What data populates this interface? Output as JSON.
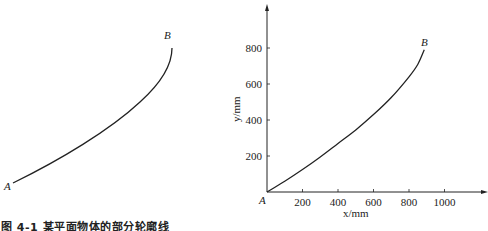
{
  "caption": "图 4-1   某平面物体的部分轮廓线",
  "left_figure": {
    "start_label": "A",
    "end_label": "B"
  },
  "chart_data": {
    "type": "line",
    "title": "",
    "xlabel": "x/mm",
    "ylabel": "y/mm",
    "xlim": [
      0,
      1200
    ],
    "ylim": [
      0,
      950
    ],
    "x_ticks": [
      200,
      400,
      600,
      800,
      1000
    ],
    "y_ticks": [
      200,
      400,
      600,
      800
    ],
    "grid": false,
    "legend": null,
    "origin_label": "A",
    "end_label": "B",
    "series": [
      {
        "name": "contour A-B",
        "x": [
          0,
          100,
          200,
          300,
          400,
          500,
          600,
          700,
          800,
          850,
          886
        ],
        "y": [
          0,
          60,
          125,
          195,
          270,
          345,
          430,
          525,
          640,
          710,
          790
        ]
      }
    ]
  }
}
